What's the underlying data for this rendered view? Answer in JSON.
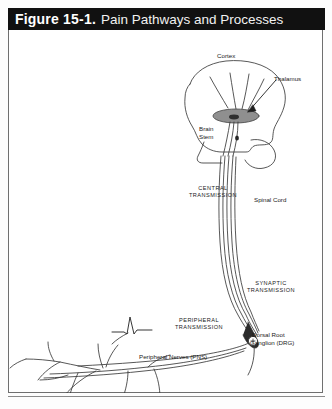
{
  "header": {
    "figure_number": "Figure 15-1.",
    "title": "Pain Pathways and Processes"
  },
  "diagram": {
    "type": "anatomical-schematic",
    "subject": "Pain Pathways and Processes",
    "labels": {
      "cortex": "Cortex",
      "thalamus": "Thalamus",
      "brain_stem_line1": "Brain",
      "brain_stem_line2": "Stem",
      "central_transmission_line1": "CENTRAL",
      "central_transmission_line2": "TRANSMISSION",
      "spinal_cord": "Spinal Cord",
      "synaptic_transmission_line1": "SYNAPTIC",
      "synaptic_transmission_line2": "TRANSMISSION",
      "peripheral_transmission_line1": "PERIPHERAL",
      "peripheral_transmission_line2": "TRANSMISSION",
      "dorsal_root_ganglion_line1": "Dorsal Root",
      "dorsal_root_ganglion_line2": "Ganglion (DRG)",
      "peripheral_nerves": "Peripheral Nerves (PNS)"
    },
    "colors": {
      "titlebar_background": "#111111",
      "titlebar_text": "#ffffff",
      "frame_border": "#6f6f6f",
      "ink": "#333333",
      "thalamus_fill": "#8c8c8c",
      "page_background": "#ffffff"
    }
  }
}
